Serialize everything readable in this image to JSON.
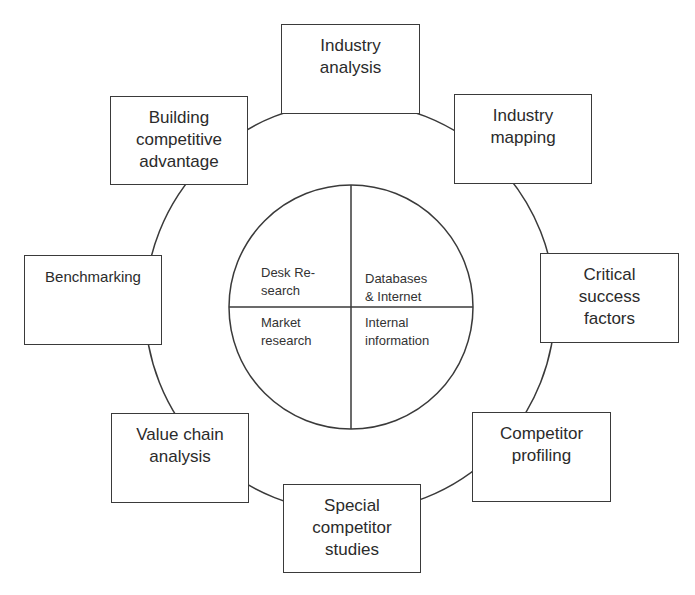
{
  "diagram": {
    "outer_nodes": [
      {
        "id": "industry-analysis",
        "lines": [
          "Industry",
          "analysis"
        ]
      },
      {
        "id": "industry-mapping",
        "lines": [
          "Industry",
          "mapping"
        ]
      },
      {
        "id": "critical-success-factors",
        "lines": [
          "Critical",
          "success",
          "factors"
        ]
      },
      {
        "id": "competitor-profiling",
        "lines": [
          "Competitor",
          "profiling"
        ]
      },
      {
        "id": "special-competitor-studies",
        "lines": [
          "Special",
          "competitor",
          "studies"
        ]
      },
      {
        "id": "value-chain-analysis",
        "lines": [
          "Value chain",
          "analysis"
        ]
      },
      {
        "id": "benchmarking",
        "lines": [
          "Benchmarking"
        ]
      },
      {
        "id": "building-competitive-advantage",
        "lines": [
          "Building",
          "competitive",
          "advantage"
        ]
      }
    ],
    "center_quadrants": [
      {
        "id": "desk-research",
        "lines": [
          "Desk Re-",
          "search"
        ]
      },
      {
        "id": "databases-internet",
        "lines": [
          "Databases",
          "& Internet"
        ]
      },
      {
        "id": "market-research",
        "lines": [
          "Market",
          "research"
        ]
      },
      {
        "id": "internal-information",
        "lines": [
          "Internal",
          "information"
        ]
      }
    ],
    "colors": {
      "stroke": "#3a3a3a",
      "text": "#2b2b2b",
      "background": "#ffffff"
    }
  }
}
